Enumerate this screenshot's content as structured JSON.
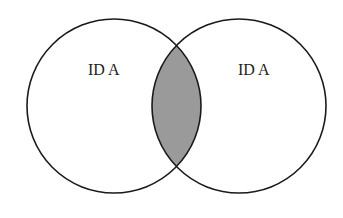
{
  "diagram": {
    "type": "venn",
    "sets": [
      {
        "label": "ID A",
        "cx": 114,
        "cy": 106,
        "r": 87
      },
      {
        "label": "ID A",
        "cx": 239,
        "cy": 106,
        "r": 87
      }
    ],
    "intersection_fill": "#9a9a9a",
    "stroke_color": "#1a1a1a"
  }
}
